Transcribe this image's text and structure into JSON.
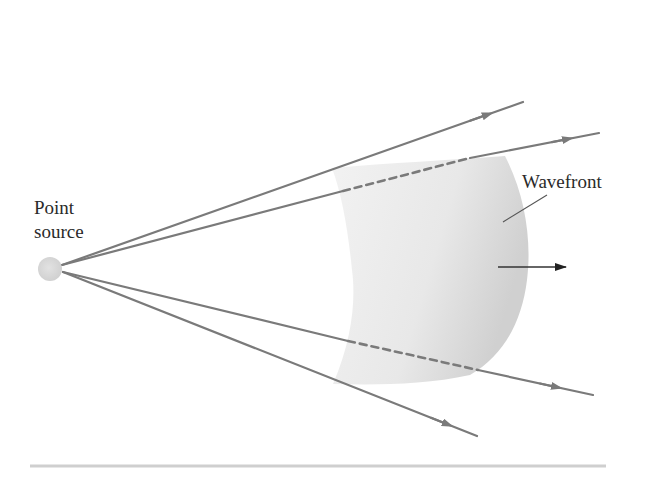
{
  "figure": {
    "labels": {
      "point_source_line1": "Point",
      "point_source_line2": "source",
      "wavefront": "Wavefront"
    },
    "elements": {
      "point_source": "light gray dot",
      "rays": [
        {
          "name": "ray-upper-outer",
          "dashed_inside_wavefront": false
        },
        {
          "name": "ray-upper-inner",
          "dashed_inside_wavefront": true
        },
        {
          "name": "ray-lower-inner",
          "dashed_inside_wavefront": true
        },
        {
          "name": "ray-lower-outer",
          "dashed_inside_wavefront": false
        }
      ],
      "propagation_arrow": "direction of wave propagation (right)"
    },
    "colors": {
      "ray": "#7a7a7a",
      "point_source": "#d4d4d4",
      "wavefront_fill_light": "#f0f0f0",
      "wavefront_fill_dark": "#d2d2d2",
      "leader_line": "#555555",
      "propagation_arrow": "#333333",
      "divider": "#cfcfcf",
      "text": "#2a2a2a"
    }
  }
}
